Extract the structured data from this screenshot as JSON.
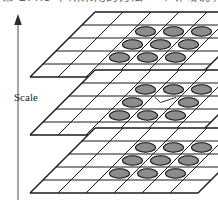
{
  "figure": {
    "kind": "scale-space-neighbourhood-diagram",
    "axis_label": "Scale",
    "axis_direction": "up",
    "cut_off_header_text": "第 2.4.3 节所采用的方法  一个邻域说明",
    "colors": {
      "line": "#1a1a1a",
      "cell_fill": "#ffffff",
      "marker_fill": "#8c8c8c",
      "marker_stroke": "#111111",
      "axis": "#555555",
      "text": "#1f1f1f",
      "background": "#ffffff"
    },
    "grid": {
      "cols": 6,
      "rows": 5,
      "cell_w": 28,
      "cell_h": 13,
      "skew_x": 13
    },
    "planes": [
      {
        "id": "plane-top",
        "name": "upper-scale-plane",
        "marker_count": 9,
        "markers": [
          {
            "col": 2,
            "row": 1
          },
          {
            "col": 3,
            "row": 1
          },
          {
            "col": 4,
            "row": 1
          },
          {
            "col": 2,
            "row": 2
          },
          {
            "col": 3,
            "row": 2
          },
          {
            "col": 4,
            "row": 2
          },
          {
            "col": 2,
            "row": 3
          },
          {
            "col": 3,
            "row": 3
          },
          {
            "col": 4,
            "row": 3
          }
        ],
        "center_empty": false
      },
      {
        "id": "plane-mid",
        "name": "current-scale-plane",
        "marker_count": 8,
        "markers": [
          {
            "col": 2,
            "row": 1
          },
          {
            "col": 3,
            "row": 1
          },
          {
            "col": 4,
            "row": 1
          },
          {
            "col": 2,
            "row": 2
          },
          {
            "col": 4,
            "row": 2
          },
          {
            "col": 2,
            "row": 3
          },
          {
            "col": 3,
            "row": 3
          },
          {
            "col": 4,
            "row": 3
          }
        ],
        "center_empty": true,
        "center_cell": {
          "col": 3,
          "row": 2
        }
      },
      {
        "id": "plane-bot",
        "name": "lower-scale-plane",
        "marker_count": 9,
        "markers": [
          {
            "col": 2,
            "row": 1
          },
          {
            "col": 3,
            "row": 1
          },
          {
            "col": 4,
            "row": 1
          },
          {
            "col": 2,
            "row": 2
          },
          {
            "col": 3,
            "row": 2
          },
          {
            "col": 4,
            "row": 2
          },
          {
            "col": 2,
            "row": 3
          },
          {
            "col": 3,
            "row": 3
          },
          {
            "col": 4,
            "row": 3
          }
        ],
        "center_empty": false
      }
    ]
  }
}
